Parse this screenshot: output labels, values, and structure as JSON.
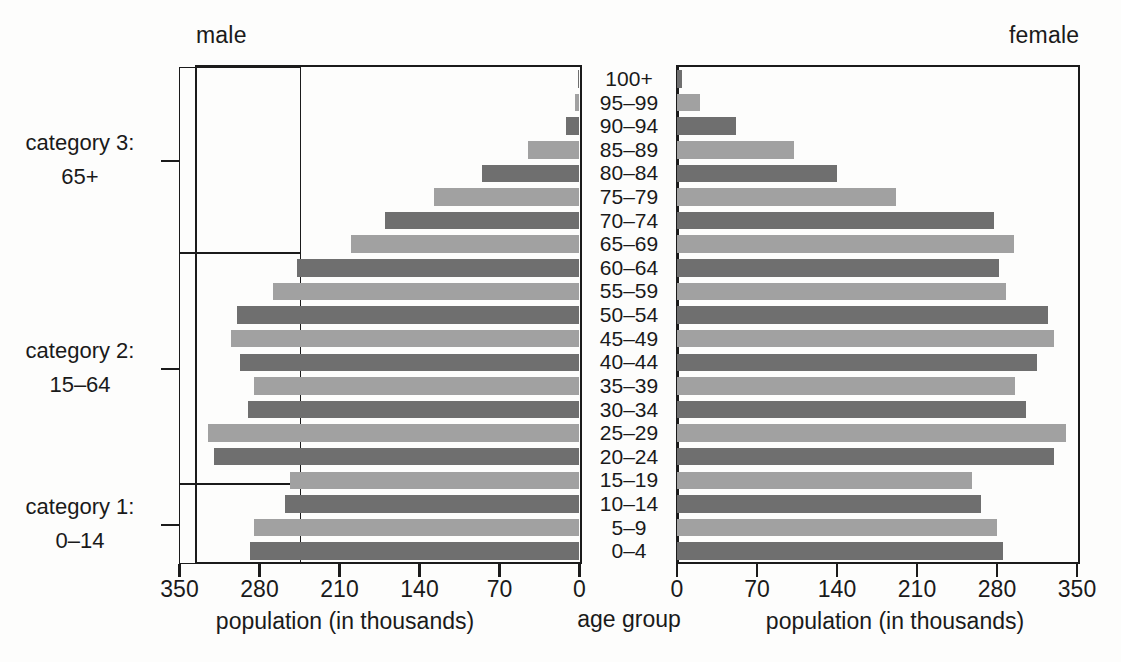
{
  "headers": {
    "male": "male",
    "female": "female"
  },
  "categories": [
    {
      "id": "cat3",
      "line1": "category 3:",
      "line2": "65+"
    },
    {
      "id": "cat2",
      "line1": "category 2:",
      "line2": "15–64"
    },
    {
      "id": "cat1",
      "line1": "category 1:",
      "line2": "0–14"
    }
  ],
  "axis": {
    "left_title": "population (in thousands)",
    "center_title": "age group",
    "right_title": "population (in thousands)",
    "left_ticks": [
      "350",
      "280",
      "210",
      "140",
      "70",
      "0"
    ],
    "right_ticks": [
      "0",
      "70",
      "140",
      "210",
      "280",
      "350"
    ],
    "max": 350,
    "tick_step": 70
  },
  "colors": {
    "bar_dark": "#6f6f6f",
    "bar_light": "#a1a1a1",
    "frame": "#1b1b1b",
    "text": "#1a1a1a",
    "background": "#fdfdfc"
  },
  "chart_data": {
    "type": "bar",
    "title": "",
    "subtype": "population-pyramid",
    "categories": [
      "100+",
      "95–99",
      "90–94",
      "85–89",
      "80–84",
      "75–79",
      "70–74",
      "65–69",
      "60–64",
      "55–59",
      "50–54",
      "45–49",
      "40–44",
      "35–39",
      "30–34",
      "25–29",
      "20–24",
      "15–19",
      "10–14",
      "5–9",
      "0–4"
    ],
    "series": [
      {
        "name": "male",
        "side": "left",
        "values": [
          1,
          4,
          12,
          45,
          85,
          127,
          170,
          200,
          247,
          268,
          300,
          305,
          297,
          285,
          290,
          325,
          320,
          253,
          258,
          285,
          288
        ]
      },
      {
        "name": "female",
        "side": "right",
        "values": [
          4,
          20,
          52,
          102,
          140,
          192,
          277,
          295,
          282,
          288,
          325,
          330,
          315,
          296,
          305,
          340,
          330,
          258,
          266,
          280,
          285
        ]
      }
    ],
    "bar_shades": [
      "dark",
      "light",
      "dark",
      "light",
      "dark",
      "light",
      "dark",
      "light",
      "dark",
      "light",
      "dark",
      "light",
      "dark",
      "light",
      "dark",
      "light",
      "dark",
      "light",
      "dark",
      "light",
      "dark"
    ],
    "xlabel": "population (in thousands)",
    "ylabel": "age group",
    "xlim": [
      0,
      350
    ],
    "grid": false,
    "legend": false
  }
}
